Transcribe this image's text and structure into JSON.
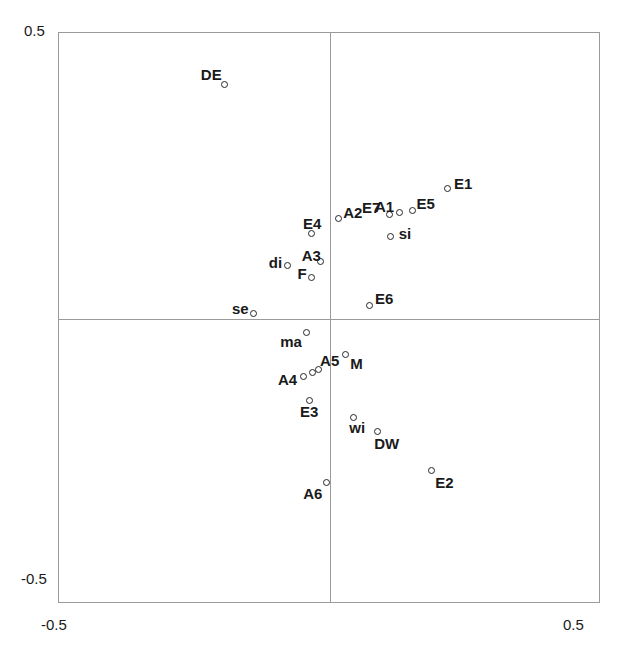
{
  "chart_data": {
    "type": "scatter",
    "title": "",
    "xlabel": "",
    "ylabel": "",
    "xlim": [
      -0.5,
      0.5
    ],
    "ylim": [
      -0.5,
      0.5
    ],
    "grid": false,
    "legend": null,
    "axis_lines_at_zero": true,
    "xticks": [
      "-0.5",
      "0.5"
    ],
    "yticks": [
      "-0.5",
      "0.5"
    ],
    "marker_style": "open-circle",
    "points": [
      {
        "label": "DE",
        "x": -0.194,
        "y": 0.409,
        "label_dx": -24,
        "label_dy": -18
      },
      {
        "label": "E1",
        "x": 0.216,
        "y": 0.227,
        "label_dx": 7,
        "label_dy": -13
      },
      {
        "label": "E5",
        "x": 0.152,
        "y": 0.19,
        "label_dx": 4,
        "label_dy": -14
      },
      {
        "label": "A1",
        "x": 0.129,
        "y": 0.185,
        "label_dx": -25,
        "label_dy": -14
      },
      {
        "label": "E7",
        "x": 0.109,
        "y": 0.183,
        "label_dx": -27,
        "label_dy": -14
      },
      {
        "label": "A2",
        "x": 0.015,
        "y": 0.175,
        "label_dx": 5,
        "label_dy": -14
      },
      {
        "label": "si",
        "x": 0.112,
        "y": 0.143,
        "label_dx": 8,
        "label_dy": -11
      },
      {
        "label": "E4",
        "x": -0.035,
        "y": 0.149,
        "label_dx": -8,
        "label_dy": -17
      },
      {
        "label": "A3",
        "x": -0.017,
        "y": 0.099,
        "label_dx": -19,
        "label_dy": -14
      },
      {
        "label": "di",
        "x": -0.078,
        "y": 0.092,
        "label_dx": -19,
        "label_dy": -11
      },
      {
        "label": "F",
        "x": -0.034,
        "y": 0.071,
        "label_dx": -14,
        "label_dy": -12
      },
      {
        "label": "E6",
        "x": 0.072,
        "y": 0.023,
        "label_dx": 6,
        "label_dy": -14
      },
      {
        "label": "se",
        "x": -0.142,
        "y": 0.009,
        "label_dx": -21,
        "label_dy": -12
      },
      {
        "label": "ma",
        "x": -0.044,
        "y": -0.025,
        "label_dx": -26,
        "label_dy": 1
      },
      {
        "label": "M",
        "x": 0.028,
        "y": -0.063,
        "label_dx": 5,
        "label_dy": 2
      },
      {
        "label": "A5",
        "x": -0.022,
        "y": -0.09,
        "label_dx": 2,
        "label_dy": -17
      },
      {
        "label": "A5b",
        "x": -0.033,
        "y": -0.095,
        "label_dx": 0,
        "label_dy": 0,
        "hide_label": true
      },
      {
        "label": "A4",
        "x": -0.048,
        "y": -0.101,
        "label_dx": -26,
        "label_dy": -4
      },
      {
        "label": "E3",
        "x": -0.037,
        "y": -0.143,
        "label_dx": -10,
        "label_dy": 4
      },
      {
        "label": "wi",
        "x": 0.043,
        "y": -0.173,
        "label_dx": -4,
        "label_dy": 3
      },
      {
        "label": "DW",
        "x": 0.087,
        "y": -0.198,
        "label_dx": -3,
        "label_dy": 4
      },
      {
        "label": "E2",
        "x": 0.187,
        "y": -0.266,
        "label_dx": 4,
        "label_dy": 5
      },
      {
        "label": "A6",
        "x": -0.007,
        "y": -0.287,
        "label_dx": -23,
        "label_dy": 4
      }
    ]
  },
  "axes": {
    "y_top_label": "0.5",
    "y_bottom_label": "-0.5",
    "x_left_label": "-0.5",
    "x_right_label": "0.5"
  }
}
